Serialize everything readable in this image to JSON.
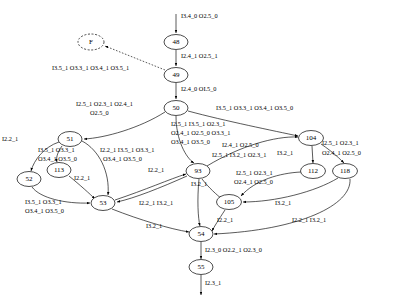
{
  "diagram": {
    "type": "state-transition-graph",
    "title": "",
    "nodes": [
      {
        "id": "F",
        "label": "F",
        "x": 91,
        "y": 42,
        "rx": 13,
        "ry": 8,
        "style": "dashed"
      },
      {
        "id": "48",
        "label": "48",
        "x": 176,
        "y": 42,
        "rx": 12,
        "ry": 7.5,
        "style": "solid"
      },
      {
        "id": "49",
        "label": "49",
        "x": 176,
        "y": 75,
        "rx": 12,
        "ry": 7.5,
        "style": "solid"
      },
      {
        "id": "50",
        "label": "50",
        "x": 176,
        "y": 108,
        "rx": 12,
        "ry": 7.5,
        "style": "solid"
      },
      {
        "id": "51",
        "label": "51",
        "x": 70,
        "y": 139,
        "rx": 12,
        "ry": 7.5,
        "style": "solid"
      },
      {
        "id": "113",
        "label": "113",
        "x": 59,
        "y": 170,
        "rx": 12,
        "ry": 7.5,
        "style": "solid"
      },
      {
        "id": "52",
        "label": "52",
        "x": 29,
        "y": 179,
        "rx": 12,
        "ry": 7.5,
        "style": "solid"
      },
      {
        "id": "53",
        "label": "53",
        "x": 103,
        "y": 203,
        "rx": 12,
        "ry": 7.5,
        "style": "solid"
      },
      {
        "id": "93",
        "label": "93",
        "x": 198,
        "y": 171,
        "rx": 12,
        "ry": 7.5,
        "style": "solid"
      },
      {
        "id": "105",
        "label": "105",
        "x": 229,
        "y": 202,
        "rx": 12.5,
        "ry": 7.5,
        "style": "solid"
      },
      {
        "id": "104",
        "label": "104",
        "x": 311,
        "y": 138,
        "rx": 12.5,
        "ry": 7.5,
        "style": "solid"
      },
      {
        "id": "112",
        "label": "112",
        "x": 313,
        "y": 171,
        "rx": 12.5,
        "ry": 7.5,
        "style": "solid"
      },
      {
        "id": "118",
        "label": "118",
        "x": 345,
        "y": 171,
        "rx": 12.5,
        "ry": 7.5,
        "style": "solid"
      },
      {
        "id": "54",
        "label": "54",
        "x": 201,
        "y": 234,
        "rx": 12,
        "ry": 7.5,
        "style": "solid"
      },
      {
        "id": "55",
        "label": "55",
        "x": 201,
        "y": 267,
        "rx": 12,
        "ry": 7.5,
        "style": "solid"
      }
    ],
    "edges": [
      {
        "from": "start",
        "to": "48",
        "label": "I3.4_0 O2.5_0"
      },
      {
        "from": "48",
        "to": "49",
        "label": "I2.4_1 O2.5_1"
      },
      {
        "from": "49",
        "to": "F",
        "label": "I3.5_1 O3.3_1 O3.4_1 O3.5_1",
        "style": "dotted"
      },
      {
        "from": "49",
        "to": "50",
        "label": "I2.4_0 OI.5_0"
      },
      {
        "from": "50",
        "to": "51",
        "label": "I2.5_1 O2.3_1 O2.4_1\nO2.5_0"
      },
      {
        "from": "50",
        "to": "104",
        "label": "I3.5_1 O3.3_1 O3.4_1 O3.5_0"
      },
      {
        "from": "50",
        "to": "93",
        "label": "I2.5_1 I3.5_1 O2.3_1\nO2.4_1 O2.5_0 O3.3_1\nO3.4_1 O3.5_0"
      },
      {
        "from": "51",
        "to": "52",
        "label": "I2.2_1"
      },
      {
        "from": "51",
        "to": "113",
        "label": "I3.5_1 O3.3_1\nO3.4_1 O3.5_0"
      },
      {
        "from": "51",
        "to": "53",
        "label": "I2.2_1 I3.5_1 O3.3_1\nO3.4_1 O3.5_0"
      },
      {
        "from": "113",
        "to": "53",
        "label": "I2.2_1"
      },
      {
        "from": "52",
        "to": "53",
        "label": "I3.5_1 O3.3_1\nO3.4_1 O3.5_0"
      },
      {
        "from": "53",
        "to": "93",
        "label": "I2.2_1"
      },
      {
        "from": "93",
        "to": "53",
        "label": "I2.2_1 I3.2_1"
      },
      {
        "from": "53",
        "to": "54",
        "label": "I3.2_1"
      },
      {
        "from": "93",
        "to": "105",
        "label": "I3.2_1"
      },
      {
        "from": "93",
        "to": "104",
        "label": "I2.4_1 O2.5_0\nI2.5_1 I3.2_1 O2.3_1"
      },
      {
        "from": "104",
        "to": "112",
        "label": "I3.2_1"
      },
      {
        "from": "104",
        "to": "118",
        "label": "I2.5_1 O2.3_1\nO2.4_1 O2.5_0"
      },
      {
        "from": "112",
        "to": "105",
        "label": "I2.5_1 O2.3_1\nO2.4_1 O2.5_0"
      },
      {
        "from": "118",
        "to": "105",
        "label": "I3.2_1"
      },
      {
        "from": "105",
        "to": "54",
        "label": "I2.2_1"
      },
      {
        "from": "118",
        "to": "54",
        "label": "I2.2_1 I3.2_1"
      },
      {
        "from": "93",
        "to": "54",
        "label": ""
      },
      {
        "from": "54",
        "to": "55",
        "label": "I2.3_0 O2.2_1 O2.3_0"
      },
      {
        "from": "55",
        "to": "end",
        "label": "I2.3_1"
      }
    ],
    "edge_labels": [
      {
        "id": "lbl-start-48",
        "text": "I3.4_0 O2.5_0",
        "x": 181,
        "y": 18,
        "align": "left"
      },
      {
        "id": "lbl-48-49",
        "text": "I2.4_1 O2.5_1",
        "x": 181,
        "y": 58,
        "align": "left"
      },
      {
        "id": "lbl-49-F",
        "text": "I3.5_1 O3.3_1 O3.4_1 O3.5_1",
        "x": 52,
        "y": 70,
        "align": "left"
      },
      {
        "id": "lbl-49-50",
        "text": "I2.4_0 OI.5_0",
        "x": 181,
        "y": 91,
        "align": "left"
      },
      {
        "id": "lbl-50-51-a",
        "text": "I2.5_1 O2.3_1 O2.4_1",
        "x": 76,
        "y": 106,
        "align": "left"
      },
      {
        "id": "lbl-50-51-b",
        "text": "O2.5_0",
        "x": 90,
        "y": 115,
        "align": "left"
      },
      {
        "id": "lbl-50-104",
        "text": "I3.5_1 O3.3_1 O3.4_1 O3.5_0",
        "x": 216,
        "y": 110,
        "align": "left"
      },
      {
        "id": "lbl-50-93-a",
        "text": "I2.5_1 I3.5_1 O2.3_1",
        "x": 171,
        "y": 126,
        "align": "left"
      },
      {
        "id": "lbl-50-93-b",
        "text": "O2.4_1 O2.5_0 O3.3_1",
        "x": 171,
        "y": 135,
        "align": "left"
      },
      {
        "id": "lbl-50-93-c",
        "text": "O3.4_1 O3.5_0",
        "x": 171,
        "y": 144,
        "align": "left"
      },
      {
        "id": "lbl-51-52",
        "text": "I2.2_1",
        "x": 2,
        "y": 141,
        "align": "left"
      },
      {
        "id": "lbl-51-113-a",
        "text": "I3.5_1 O3.3_1",
        "x": 38,
        "y": 152,
        "align": "left"
      },
      {
        "id": "lbl-51-113-b",
        "text": "O3.4_1 O3.5_0",
        "x": 38,
        "y": 161,
        "align": "left"
      },
      {
        "id": "lbl-51-53-a",
        "text": "I2.2_1 I3.5_1 O3.3_1",
        "x": 100,
        "y": 152,
        "align": "left"
      },
      {
        "id": "lbl-51-53-b",
        "text": "O3.4_1 O3.5_0",
        "x": 103,
        "y": 161,
        "align": "left"
      },
      {
        "id": "lbl-113-53",
        "text": "I2.2_1",
        "x": 74,
        "y": 180,
        "align": "left"
      },
      {
        "id": "lbl-52-53-a",
        "text": "I3.5_1 O3.3_1",
        "x": 25,
        "y": 204,
        "align": "left"
      },
      {
        "id": "lbl-52-53-b",
        "text": "O3.4_1 O3.5_0",
        "x": 25,
        "y": 213,
        "align": "left"
      },
      {
        "id": "lbl-53-93",
        "text": "I2.2_1",
        "x": 148,
        "y": 172,
        "align": "left"
      },
      {
        "id": "lbl-93-53",
        "text": "I2.2_1 I3.2_1",
        "x": 139,
        "y": 205,
        "align": "left"
      },
      {
        "id": "lbl-53-54",
        "text": "I3.2_1",
        "x": 146,
        "y": 228,
        "align": "left"
      },
      {
        "id": "lbl-93-105",
        "text": "I3.2_1",
        "x": 191,
        "y": 186,
        "align": "left"
      },
      {
        "id": "lbl-93-104-a",
        "text": "I2.4_1 O2.5_0",
        "x": 222,
        "y": 147,
        "align": "left"
      },
      {
        "id": "lbl-93-104-b",
        "text": "I2.5_1 I3.2_1 O2.3_1",
        "x": 212,
        "y": 157,
        "align": "left"
      },
      {
        "id": "lbl-104-112",
        "text": "I3.2_1",
        "x": 277,
        "y": 155,
        "align": "left"
      },
      {
        "id": "lbl-104-118-a",
        "text": "I2.5_1 O2.3_1",
        "x": 322,
        "y": 145,
        "align": "left"
      },
      {
        "id": "lbl-104-118-b",
        "text": "O2.4_1 O2.5_0",
        "x": 322,
        "y": 155,
        "align": "left"
      },
      {
        "id": "lbl-112-105-a",
        "text": "I2.5_1 O2.3_1",
        "x": 236,
        "y": 175,
        "align": "left"
      },
      {
        "id": "lbl-112-105-b",
        "text": "O2.4_1 O2.5_0",
        "x": 234,
        "y": 184,
        "align": "left"
      },
      {
        "id": "lbl-118-105",
        "text": "I3.2_1",
        "x": 275,
        "y": 205,
        "align": "left"
      },
      {
        "id": "lbl-105-54",
        "text": "I2.2_1",
        "x": 217,
        "y": 222,
        "align": "left"
      },
      {
        "id": "lbl-118-54",
        "text": "I2.2_1 I3.2_1",
        "x": 292,
        "y": 222,
        "align": "left"
      },
      {
        "id": "lbl-54-55",
        "text": "I2.3_0 O2.2_1 O2.3_0",
        "x": 205,
        "y": 252,
        "align": "left"
      },
      {
        "id": "lbl-55-end",
        "text": "I2.3_1",
        "x": 205,
        "y": 285,
        "align": "left"
      }
    ]
  }
}
